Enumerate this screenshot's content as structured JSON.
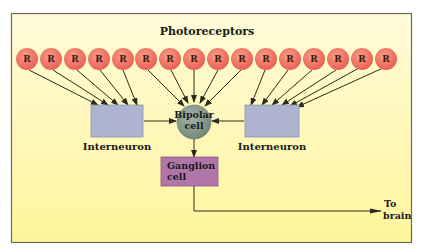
{
  "title": "Photoreceptors",
  "photoreceptor_label": "R",
  "photoreceptor_count": 17,
  "nodes": {
    "left_interneuron": {
      "label": "Interneuron"
    },
    "right_interneuron": {
      "label": "Interneuron"
    },
    "bipolar": {
      "line1": "Bipolar",
      "line2": "cell"
    },
    "ganglion": {
      "line1": "Ganglion",
      "line2": "cell"
    },
    "output": {
      "line1": "To",
      "line2": "brain"
    }
  },
  "colors": {
    "frame_border": "#6b6a55",
    "background_top": "#fffbd6",
    "background_bottom": "#fff6a0",
    "photoreceptor_fill": "#ee6a5a",
    "photoreceptor_stroke": "#d9564a",
    "interneuron_fill": "#aeb4cf",
    "bipolar_fill": "#7f9486",
    "ganglion_fill": "#b076a8",
    "arrow": "#2b2a1c"
  }
}
